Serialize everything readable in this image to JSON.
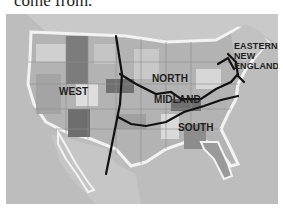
{
  "caption": {
    "text": "come from."
  },
  "map": {
    "title": "Dialect regions of the United States",
    "colors": {
      "ocean": "#bdbdbd",
      "land_light": "#d2d2d2",
      "land_mid": "#a9a9a9",
      "land_dark": "#7a7a7a",
      "coast_glow": "#f2f2f2",
      "boundary_line": "#111111"
    },
    "regions": [
      {
        "id": "west",
        "label": "WEST"
      },
      {
        "id": "north",
        "label": "NORTH"
      },
      {
        "id": "midland",
        "label": "MIDLAND"
      },
      {
        "id": "south",
        "label": "SOUTH"
      },
      {
        "id": "eastern-new-england",
        "label_lines": [
          "EASTERN",
          "NEW",
          "ENGLAND"
        ]
      }
    ]
  }
}
